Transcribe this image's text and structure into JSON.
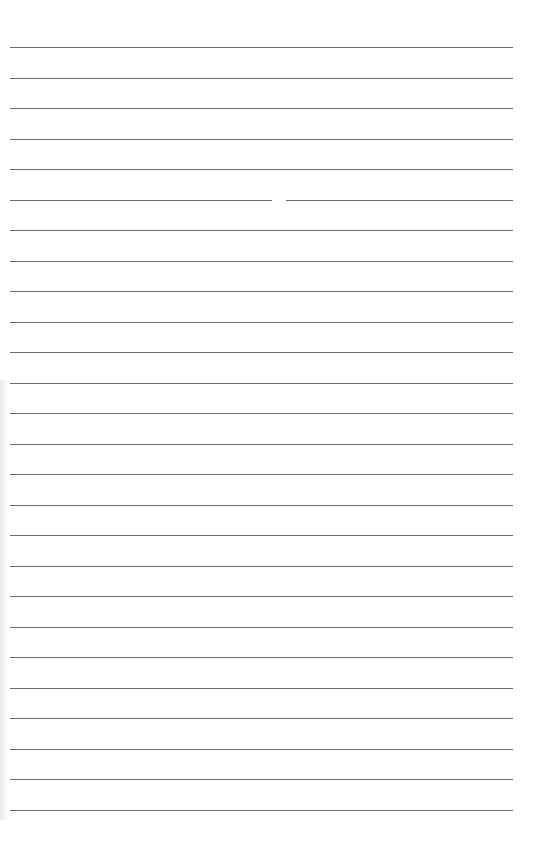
{
  "page": {
    "type": "lined-paper",
    "line_count": 26,
    "first_line_y": 47,
    "line_spacing": 30.5,
    "line_left": 10,
    "line_right": 513,
    "line_color": "#6a6a6a",
    "background": "#ffffff"
  }
}
